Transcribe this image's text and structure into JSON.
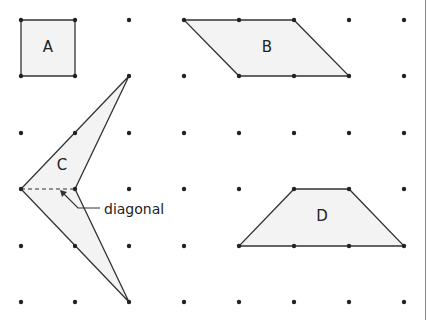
{
  "grid": {
    "xs": [
      21,
      75,
      129,
      184,
      239,
      294,
      349,
      404
    ],
    "ys": [
      20,
      76,
      133,
      189,
      246,
      302
    ],
    "dot_color": "#222222"
  },
  "colors": {
    "fill": "#f3f3f3",
    "stroke": "#333333",
    "text": "#222222"
  },
  "shapes": [
    {
      "label": "A",
      "points": [
        [
          21,
          20
        ],
        [
          75,
          20
        ],
        [
          75,
          76
        ],
        [
          21,
          76
        ]
      ],
      "label_pos": [
        48,
        52
      ],
      "vertices": [
        [
          21,
          20
        ],
        [
          75,
          20
        ],
        [
          75,
          76
        ],
        [
          21,
          76
        ]
      ]
    },
    {
      "label": "B",
      "points": [
        [
          184,
          20
        ],
        [
          294,
          20
        ],
        [
          349,
          76
        ],
        [
          239,
          76
        ]
      ],
      "label_pos": [
        267,
        52
      ],
      "vertices": [
        [
          184,
          20
        ],
        [
          239,
          20
        ],
        [
          294,
          20
        ],
        [
          239,
          76
        ],
        [
          294,
          76
        ],
        [
          349,
          76
        ]
      ]
    },
    {
      "label": "C",
      "points": [
        [
          129,
          76
        ],
        [
          21,
          189
        ],
        [
          129,
          302
        ],
        [
          75,
          189
        ]
      ],
      "label_pos": [
        62,
        170
      ],
      "vertices": [
        [
          129,
          76
        ],
        [
          75,
          133
        ],
        [
          21,
          189
        ],
        [
          75,
          189
        ],
        [
          75,
          246
        ],
        [
          129,
          302
        ]
      ]
    },
    {
      "label": "D",
      "points": [
        [
          294,
          189
        ],
        [
          349,
          189
        ],
        [
          404,
          246
        ],
        [
          239,
          246
        ]
      ],
      "label_pos": [
        322,
        221
      ],
      "vertices": [
        [
          294,
          189
        ],
        [
          349,
          189
        ],
        [
          239,
          246
        ],
        [
          294,
          246
        ],
        [
          349,
          246
        ],
        [
          404,
          246
        ]
      ]
    }
  ],
  "annotation": {
    "text": "diagonal",
    "text_pos": [
      104,
      214
    ],
    "diagonal_from": [
      21,
      189
    ],
    "diagonal_to": [
      75,
      189
    ]
  }
}
